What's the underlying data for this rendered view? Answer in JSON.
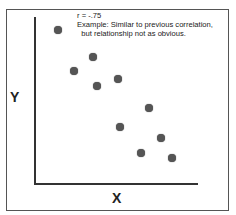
{
  "chart_data": {
    "type": "scatter",
    "title": "",
    "xlabel": "X",
    "ylabel": "Y",
    "annotation": {
      "r_label": "r = -.75",
      "line1": "Example: Similar to previous correlation,",
      "line2": "  but relationship not as obvious."
    },
    "correlation": -0.75,
    "grid": false,
    "ticks": false,
    "points_px": [
      {
        "x": 58,
        "y": 30
      },
      {
        "x": 93,
        "y": 57
      },
      {
        "x": 74,
        "y": 71
      },
      {
        "x": 118,
        "y": 79
      },
      {
        "x": 97,
        "y": 86
      },
      {
        "x": 149,
        "y": 108
      },
      {
        "x": 120,
        "y": 127
      },
      {
        "x": 161,
        "y": 138
      },
      {
        "x": 141,
        "y": 153
      },
      {
        "x": 172,
        "y": 158
      }
    ],
    "point_color": "#555555"
  }
}
